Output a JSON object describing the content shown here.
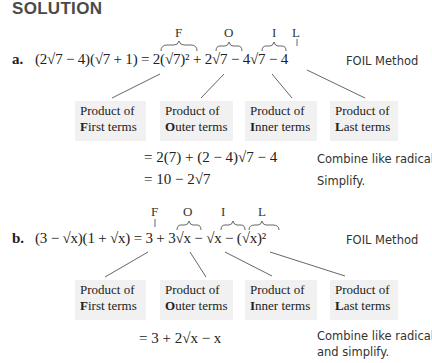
{
  "heading": "SOLUTION",
  "part_a": {
    "label": "a.",
    "expression": "(2√7 − 4)(√7 + 1) = 2(√7)² + 2√7 − 4√7 − 4",
    "foil_letters": [
      "F",
      "O",
      "I",
      "L"
    ],
    "method_note": "FOIL Method",
    "boxes": [
      {
        "line1": "Product of",
        "first": "F",
        "rest": "irst terms"
      },
      {
        "line1": "Product of",
        "first": "O",
        "rest": "uter terms"
      },
      {
        "line1": "Product of",
        "first": "I",
        "rest": "nner terms"
      },
      {
        "line1": "Product of",
        "first": "L",
        "rest": "ast terms"
      }
    ],
    "steps": [
      {
        "expr": "= 2(7) + (2 − 4)√7 − 4",
        "note": "Combine like radicals."
      },
      {
        "expr": "= 10 − 2√7",
        "note": "Simplify."
      }
    ]
  },
  "part_b": {
    "label": "b.",
    "expression": "(3 − √x)(1 + √x) = 3 + 3√x − √x − (√x)²",
    "foil_letters": [
      "F",
      "O",
      "I",
      "L"
    ],
    "method_note": "FOIL Method",
    "boxes": [
      {
        "line1": "Product of",
        "first": "F",
        "rest": "irst terms"
      },
      {
        "line1": "Product of",
        "first": "O",
        "rest": "uter terms"
      },
      {
        "line1": "Product of",
        "first": "I",
        "rest": "nner terms"
      },
      {
        "line1": "Product of",
        "first": "L",
        "rest": "ast terms"
      }
    ],
    "steps": [
      {
        "expr": "= 3 + 2√x − x",
        "note_line1": "Combine like radicals",
        "note_line2": "and simplify."
      }
    ]
  }
}
